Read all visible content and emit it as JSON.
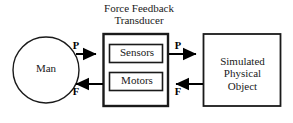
{
  "diagram": {
    "title_line1": "Force Feedback",
    "title_line2": "Transducer",
    "nodes": {
      "man": {
        "label": "Man",
        "shape": "ellipse"
      },
      "transducer": {
        "label": "Force Feedback Transducer",
        "shape": "rect"
      },
      "sensors": {
        "label": "Sensors",
        "shape": "rect"
      },
      "motors": {
        "label": "Motors",
        "shape": "rect"
      },
      "object": {
        "label": "Simulated Physical Object",
        "line1": "Simulated",
        "line2": "Physical",
        "line3": "Object",
        "shape": "rect"
      }
    },
    "edges": [
      {
        "id": "man-to-transducer",
        "label": "P",
        "from": "man",
        "to": "transducer",
        "direction": "right"
      },
      {
        "id": "transducer-to-object",
        "label": "P",
        "from": "transducer",
        "to": "object",
        "direction": "right"
      },
      {
        "id": "object-to-transducer",
        "label": "F",
        "from": "object",
        "to": "transducer",
        "direction": "left"
      },
      {
        "id": "transducer-to-man",
        "label": "F",
        "from": "transducer",
        "to": "man",
        "direction": "left"
      }
    ],
    "colors": {
      "stroke": "#1a1a1a",
      "arrow": "#000000",
      "background": "#ffffff",
      "text": "#1a1a1a"
    }
  }
}
